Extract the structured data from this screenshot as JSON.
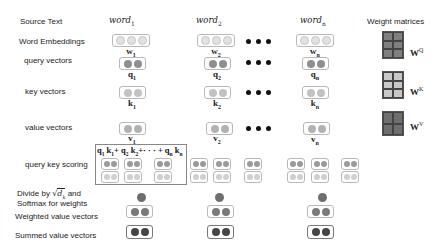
{
  "row_labels": {
    "source_text": "Source Text",
    "word_embeddings": "Word Embeddings",
    "query_vectors": "query vectors",
    "key_vectors": "key vectors",
    "value_vectors": "value vectors",
    "query_key_scoring": "query key scoring",
    "divide_line1_pre": "Divide by",
    "divide_sqrt_symbol": "√",
    "divide_dk": "d",
    "divide_dk_sub": "k",
    "divide_line1_post": "and",
    "divide_line2": "Softmax for weights",
    "weighted_value_vectors": "Weighted value vectors",
    "summed_value_vectors": "Summed value vectors"
  },
  "columns": [
    {
      "word": "word",
      "sub": "1",
      "w": "w",
      "q": "q",
      "k": "k",
      "v": "v",
      "idx": "1"
    },
    {
      "word": "word",
      "sub": "2",
      "w": "w",
      "q": "q",
      "k": "k",
      "v": "v",
      "idx": "2"
    },
    {
      "word": "word",
      "sub": "n",
      "w": "w",
      "q": "q",
      "k": "k",
      "v": "v",
      "idx": "n"
    }
  ],
  "weight_matrices": {
    "title": "Weight matrices",
    "items": [
      {
        "name": "W",
        "sup": "Q",
        "color": "#7f7f7f"
      },
      {
        "name": "W",
        "sup": "K",
        "color": "#c8c8c8"
      },
      {
        "name": "W",
        "sup": "V",
        "color": "#6f6f6f"
      }
    ]
  },
  "scoring_formula": {
    "t1": "q",
    "s1": "1",
    "t2": "k",
    "s2": "1",
    "plus1": "+",
    "t3": "q",
    "s3": "2",
    "t4": "k",
    "s4": "2",
    "plus2": "+· · · +",
    "t5": "q",
    "s5": "n",
    "t6": "k",
    "s6": "n"
  },
  "colors": {
    "query": "#8f8f8f",
    "key": "#c2c2c2",
    "value": "#b2b2b2",
    "weighted": "#7a7a7a",
    "summed": "#454545",
    "embedding": "#e2e2e2"
  }
}
